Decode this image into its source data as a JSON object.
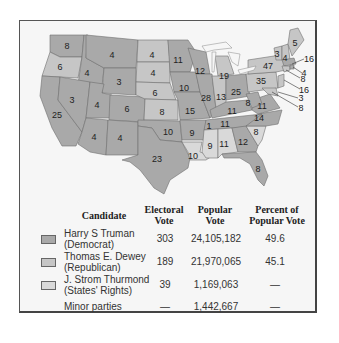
{
  "colors": {
    "democrat": "#a9a9a9",
    "republican": "#c6c6c6",
    "states_rights": "#d9d9d9",
    "frame_bg": "#f6f6f6",
    "border": "#6e6e6e"
  },
  "map": {
    "states": [
      {
        "abbr": "WA",
        "votes": "8",
        "party": "democrat"
      },
      {
        "abbr": "OR",
        "votes": "6",
        "party": "republican"
      },
      {
        "abbr": "CA",
        "votes": "25",
        "party": "democrat"
      },
      {
        "abbr": "ID",
        "votes": "4",
        "party": "democrat"
      },
      {
        "abbr": "NV",
        "votes": "3",
        "party": "democrat"
      },
      {
        "abbr": "MT",
        "votes": "4",
        "party": "democrat"
      },
      {
        "abbr": "WY",
        "votes": "3",
        "party": "democrat"
      },
      {
        "abbr": "UT",
        "votes": "4",
        "party": "democrat"
      },
      {
        "abbr": "CO",
        "votes": "6",
        "party": "democrat"
      },
      {
        "abbr": "AZ",
        "votes": "4",
        "party": "democrat"
      },
      {
        "abbr": "NM",
        "votes": "4",
        "party": "democrat"
      },
      {
        "abbr": "ND",
        "votes": "4",
        "party": "republican"
      },
      {
        "abbr": "SD",
        "votes": "4",
        "party": "republican"
      },
      {
        "abbr": "NE",
        "votes": "6",
        "party": "republican"
      },
      {
        "abbr": "KS",
        "votes": "8",
        "party": "republican"
      },
      {
        "abbr": "OK",
        "votes": "10",
        "party": "democrat"
      },
      {
        "abbr": "TX",
        "votes": "23",
        "party": "democrat"
      },
      {
        "abbr": "MN",
        "votes": "11",
        "party": "democrat"
      },
      {
        "abbr": "IA",
        "votes": "10",
        "party": "democrat"
      },
      {
        "abbr": "MO",
        "votes": "15",
        "party": "democrat"
      },
      {
        "abbr": "AR",
        "votes": "9",
        "party": "democrat"
      },
      {
        "abbr": "LA",
        "votes": "10",
        "party": "states_rights"
      },
      {
        "abbr": "WI",
        "votes": "12",
        "party": "democrat"
      },
      {
        "abbr": "IL",
        "votes": "28",
        "party": "democrat"
      },
      {
        "abbr": "MI",
        "votes": "19",
        "party": "republican"
      },
      {
        "abbr": "IN",
        "votes": "13",
        "party": "republican"
      },
      {
        "abbr": "OH",
        "votes": "25",
        "party": "democrat"
      },
      {
        "abbr": "KY",
        "votes": "11",
        "party": "democrat"
      },
      {
        "abbr": "TN",
        "votes": "11",
        "party": "democrat"
      },
      {
        "abbr": "TN-split",
        "votes": "1",
        "party": "states_rights"
      },
      {
        "abbr": "MS",
        "votes": "9",
        "party": "states_rights"
      },
      {
        "abbr": "AL",
        "votes": "11",
        "party": "states_rights"
      },
      {
        "abbr": "GA",
        "votes": "12",
        "party": "democrat"
      },
      {
        "abbr": "FL",
        "votes": "8",
        "party": "democrat"
      },
      {
        "abbr": "SC",
        "votes": "8",
        "party": "states_rights"
      },
      {
        "abbr": "NC",
        "votes": "14",
        "party": "democrat"
      },
      {
        "abbr": "VA",
        "votes": "11",
        "party": "democrat"
      },
      {
        "abbr": "WV",
        "votes": "8",
        "party": "democrat"
      },
      {
        "abbr": "PA",
        "votes": "35",
        "party": "republican"
      },
      {
        "abbr": "NY",
        "votes": "47",
        "party": "republican"
      },
      {
        "abbr": "VT",
        "votes": "3",
        "party": "republican"
      },
      {
        "abbr": "NH",
        "votes": "4",
        "party": "republican"
      },
      {
        "abbr": "ME",
        "votes": "5",
        "party": "republican"
      },
      {
        "abbr": "MA",
        "votes": "16",
        "party": "democrat"
      },
      {
        "abbr": "RI",
        "votes": "4",
        "party": "democrat"
      },
      {
        "abbr": "CT",
        "votes": "8",
        "party": "republican"
      },
      {
        "abbr": "NJ",
        "votes": "16",
        "party": "republican"
      },
      {
        "abbr": "DE",
        "votes": "3",
        "party": "republican"
      },
      {
        "abbr": "MD",
        "votes": "8",
        "party": "republican"
      }
    ]
  },
  "table": {
    "headers": {
      "candidate": "Candidate",
      "electoral_1": "Electoral",
      "electoral_2": "Vote",
      "popular_1": "Popular",
      "popular_2": "Vote",
      "percent_1": "Percent of",
      "percent_2": "Popular Vote"
    },
    "rows": [
      {
        "name": "Harry S Truman",
        "party": "(Democrat)",
        "electoral": "303",
        "popular": "24,105,182",
        "percent": "49.6"
      },
      {
        "name": "Thomas E. Dewey",
        "party": "(Republican)",
        "electoral": "189",
        "popular": "21,970,065",
        "percent": "45.1"
      },
      {
        "name": "J. Strom Thurmond",
        "party": "(States' Rights)",
        "electoral": "39",
        "popular": "1,169,063",
        "percent": "—"
      },
      {
        "name": "Minor parties",
        "party": "",
        "electoral": "—",
        "popular": "1,442,667",
        "percent": "—"
      }
    ]
  }
}
